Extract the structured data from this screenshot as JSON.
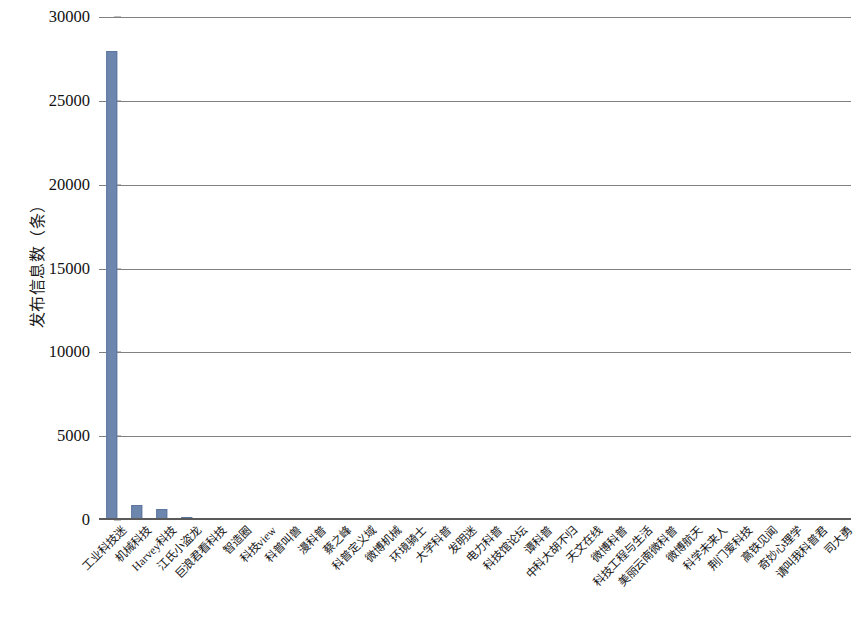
{
  "chart_data": {
    "type": "bar",
    "title": "",
    "subtitle": "",
    "xlabel": "",
    "ylabel": "发布信息数（条）",
    "ylim": [
      0,
      30000
    ],
    "yticks": [
      0,
      5000,
      10000,
      15000,
      20000,
      25000,
      30000
    ],
    "ytick_labels": [
      "0",
      "5000",
      "10000",
      "15000",
      "20000",
      "25000",
      "30000"
    ],
    "grid": "horizontal",
    "legend": "none",
    "bar_color": "#6d86ae",
    "gridline_color": "#808080",
    "axis_color": "#5a5a5a",
    "categories": [
      "工业科技迷",
      "机械科技",
      "Harvey科技",
      "江氏小盗龙",
      "巨浪君看科技",
      "智造圈",
      "科技view",
      "科普叫兽",
      "漫科普",
      "蔡之峰",
      "科普定义域",
      "微博机械",
      "环境骑士",
      "大学科普",
      "发明迷",
      "电力科普",
      "科技馆论坛",
      "谭科普",
      "中科大胡不归",
      "天文在线",
      "微博科普",
      "科技工程与生活",
      "美丽云南微科普",
      "微博航天",
      "科学未来人",
      "荆门爱科技",
      "高铁见闻",
      "奇妙心理学",
      "请叫我科普君",
      "司大勇"
    ],
    "values": [
      28000,
      900,
      650,
      180,
      150,
      140,
      130,
      125,
      120,
      115,
      110,
      108,
      105,
      100,
      98,
      95,
      92,
      90,
      88,
      85,
      82,
      80,
      78,
      75,
      72,
      70,
      68,
      65,
      62,
      58
    ]
  }
}
